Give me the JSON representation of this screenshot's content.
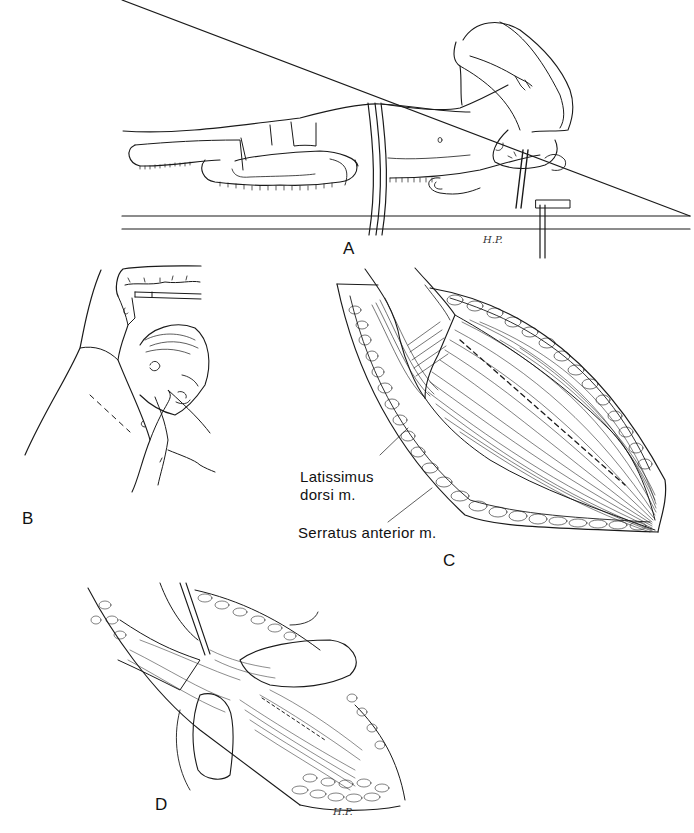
{
  "figure": {
    "panels": [
      {
        "id": "A",
        "label": "A",
        "description": "Patient in lateral decubitus position on operating table, arm suspended overhead, strapped at hips",
        "signature": "H.P."
      },
      {
        "id": "B",
        "label": "B",
        "description": "Close-up of patient positioned on side with arm raised; dashed incision line along lateral chest wall"
      },
      {
        "id": "C",
        "label": "C",
        "description": "Exposed muscle through incision with dashed line on latissimus dorsi",
        "annotations": [
          {
            "text_line1": "Latissimus",
            "text_line2": "dorsi m.",
            "target": "latissimus dorsi muscle"
          },
          {
            "text_line1": "Serratus anterior m.",
            "target": "serratus anterior muscle"
          }
        ]
      },
      {
        "id": "D",
        "label": "D",
        "description": "Surgeon's fingers and forceps separating muscle fibers along dashed line",
        "signature": "H.P."
      }
    ],
    "caption_truncated": true
  },
  "colors": {
    "ink": "#1a1a1a",
    "background": "#ffffff"
  }
}
